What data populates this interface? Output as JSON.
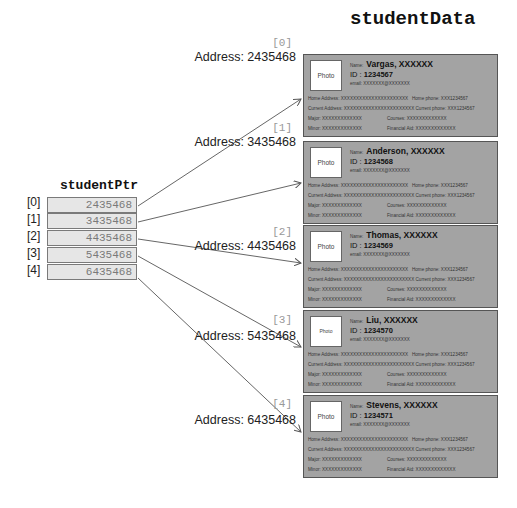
{
  "student_data_title": "studentData",
  "student_ptr_title": "studentPtr",
  "pointer_array": [
    {
      "index": "[0]",
      "value": "2435468"
    },
    {
      "index": "[1]",
      "value": "3435468"
    },
    {
      "index": "[2]",
      "value": "4435468"
    },
    {
      "index": "[3]",
      "value": "5435468"
    },
    {
      "index": "[4]",
      "value": "6435468"
    }
  ],
  "labels": {
    "photo": "Photo",
    "name": "Name:",
    "id": "ID : ",
    "email": "email:",
    "home_address": "Home Address:",
    "home_phone": "Home phone:",
    "current_address": "Current Address:",
    "current_phone": "Current phone:",
    "major": "Major:",
    "courses": "Courses:",
    "minor": "Minor:",
    "financial_aid": "Financial Aid:"
  },
  "records": [
    {
      "index": "[0]",
      "address": "Address: 2435468",
      "name": "Vargas, XXXXXX",
      "id": "1234567",
      "email": "XXXXXXX@XXXXXXX",
      "home_address": "XXXXXXXXXXXXXXXXXXXXXX",
      "home_phone": "XXX1234567",
      "current_address": "XXXXXXXXXXXXXXXXXXXXXXX",
      "current_phone": "XXX1234567",
      "major": "XXXXXXXXXXXXX",
      "courses": "XXXXXXXXXXXXX",
      "minor": "XXXXXXXXXXXXX",
      "financial_aid": "XXXXXXXXXXXXX"
    },
    {
      "index": "[1]",
      "address": "Address: 3435468",
      "name": "Anderson, XXXXXX",
      "id": "1234568",
      "email": "XXXXXXX@XXXXXXX",
      "home_address": "XXXXXXXXXXXXXXXXXXXXXX",
      "home_phone": "XXX1234567",
      "current_address": "XXXXXXXXXXXXXXXXXXXXXXX",
      "current_phone": "XXX1234567",
      "major": "XXXXXXXXXXXXX",
      "courses": "XXXXXXXXXXXXX",
      "minor": "XXXXXXXXXXXXX",
      "financial_aid": "XXXXXXXXXXXXX"
    },
    {
      "index": "[2]",
      "address": "Address: 4435468",
      "name": "Thomas, XXXXXX",
      "id": "1234569",
      "email": "XXXXXXX@XXXXXXX",
      "home_address": "XXXXXXXXXXXXXXXXXXXXXX",
      "home_phone": "XXX1234567",
      "current_address": "XXXXXXXXXXXXXXXXXXXXXXX",
      "current_phone": "XXX1234567",
      "major": "XXXXXXXXXXXXX",
      "courses": "XXXXXXXXXXXXX",
      "minor": "XXXXXXXXXXXXX",
      "financial_aid": "XXXXXXXXXXXXX"
    },
    {
      "index": "[3]",
      "address": "Address: 5435468",
      "name": "Liu, XXXXXX",
      "id": "1234570",
      "email": "XXXXXXX@XXXXXXX",
      "home_address": "XXXXXXXXXXXXXXXXXXXXXX",
      "home_phone": "XXX1234567",
      "current_address": "XXXXXXXXXXXXXXXXXXXXXXX",
      "current_phone": "XXX1234567",
      "major": "XXXXXXXXXXXXX",
      "courses": "XXXXXXXXXXXXX",
      "minor": "XXXXXXXXXXXXX",
      "financial_aid": "XXXXXXXXXXXXX"
    },
    {
      "index": "[4]",
      "address": "Address: 6435468",
      "name": "Stevens, XXXXXX",
      "id": "1234571",
      "email": "XXXXXXX@XXXXXXX",
      "home_address": "XXXXXXXXXXXXXXXXXXXXXX",
      "home_phone": "XXX1234567",
      "current_address": "XXXXXXXXXXXXXXXXXXXXXXX",
      "current_phone": "XXX1234567",
      "major": "XXXXXXXXXXXXX",
      "courses": "XXXXXXXXXXXXX",
      "minor": "XXXXXXXXXXXXX",
      "financial_aid": "XXXXXXXXXXXXX"
    }
  ],
  "colors": {
    "card_fill": "#a3a3a3",
    "card_border": "#555555",
    "cell_fill": "#e6e6e6",
    "cell_text": "#7a7a7a",
    "arrow": "#555555"
  }
}
